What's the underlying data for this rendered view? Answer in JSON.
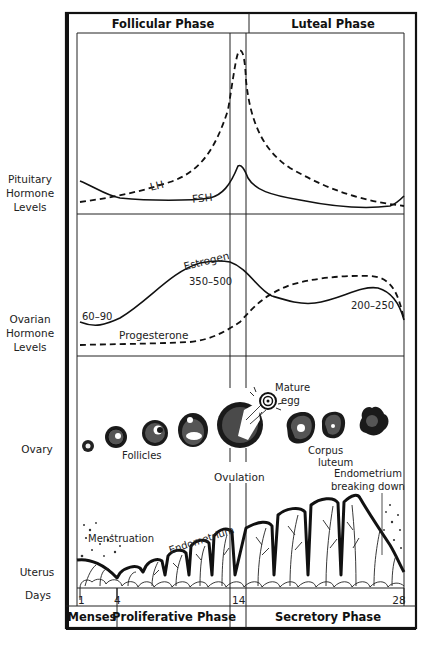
{
  "header": {
    "phases": [
      "Follicular Phase",
      "Luteal Phase"
    ]
  },
  "row_labels": {
    "pituitary": [
      "Pituitary",
      "Hormone",
      "Levels"
    ],
    "ovarian": [
      "Ovarian",
      "Hormone",
      "Levels"
    ],
    "ovary": "Ovary",
    "uterus": "Uterus",
    "days": "Days"
  },
  "pituitary_panel": {
    "lh_label": "LH",
    "fsh_label": "FSH"
  },
  "ovarian_panel": {
    "estrogen_label": "Estrogen",
    "progesterone_label": "Progesterone",
    "values": {
      "early": "60–90",
      "peak": "350–500",
      "luteal": "200–250"
    }
  },
  "ovary_panel": {
    "follicles_label": "Follicles",
    "ovulation_label": "Ovulation",
    "mature_egg_label": [
      "Mature",
      "egg"
    ],
    "corpus_luteum_label": [
      "Corpus",
      "luteum"
    ],
    "endometrium_breakdown_label": [
      "Endometrium",
      "breaking down"
    ]
  },
  "uterus_panel": {
    "menstruation_label": "Menstruation",
    "endometrium_label": "Endometrium"
  },
  "days": {
    "ticks": [
      "1",
      "4",
      "14",
      "28"
    ]
  },
  "footer": {
    "phases": [
      "Menses",
      "Proliferative Phase",
      "Secretory Phase"
    ]
  }
}
